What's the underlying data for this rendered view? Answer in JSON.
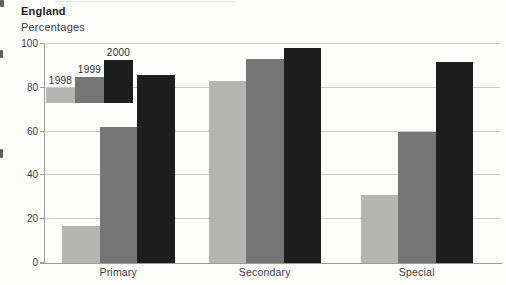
{
  "header": {
    "title": "England",
    "subtitle": "Percentages"
  },
  "chart_data": {
    "type": "bar",
    "title": "England",
    "units_label": "Percentages",
    "categories": [
      "Primary",
      "Secondary",
      "Special"
    ],
    "series": [
      {
        "name": "1998",
        "color": "#b5b5b3",
        "values": [
          17,
          83,
          31
        ]
      },
      {
        "name": "1999",
        "color": "#757575",
        "values": [
          62,
          93,
          60
        ]
      },
      {
        "name": "2000",
        "color": "#1d1d1d",
        "values": [
          86,
          98,
          92
        ]
      }
    ],
    "ylim": [
      0,
      100
    ],
    "yticks": [
      0,
      20,
      40,
      60,
      80,
      100
    ],
    "grid": true,
    "legend": {
      "position": "top-left",
      "style": "staircase-swatches",
      "labels": [
        "1998",
        "1999",
        "2000"
      ]
    }
  },
  "colors": {
    "gridline": "#cbcbcb",
    "axis": "#9c9c9c",
    "text": "#3d3d3d"
  }
}
